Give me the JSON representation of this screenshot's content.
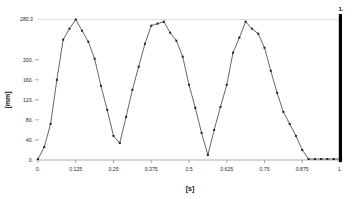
{
  "chart_data": {
    "type": "line",
    "title": "",
    "subtitle": "",
    "xlabel": "[s]",
    "ylabel": "[mm]",
    "xlim": [
      0,
      1
    ],
    "ylim": [
      0,
      280.3
    ],
    "grid": "horizontal-top-only",
    "legend": "none",
    "x_ticks": [
      "0.",
      "0.125",
      "0.25",
      "0.375",
      "0.5",
      "0.625",
      "0.75",
      "0.875",
      "1."
    ],
    "x_tick_values": [
      0,
      0.125,
      0.25,
      0.375,
      0.5,
      0.625,
      0.75,
      0.875,
      1
    ],
    "y_ticks": [
      "0.",
      "40.",
      "80.",
      "120.",
      "160.",
      "200.",
      "280.3"
    ],
    "y_tick_values": [
      0,
      40,
      80,
      120,
      160,
      200,
      280.3
    ],
    "series": [
      {
        "name": "displacement",
        "marker": "square",
        "color": "#333333",
        "x": [
          0,
          0.0208,
          0.0417,
          0.0625,
          0.0833,
          0.1042,
          0.125,
          0.1458,
          0.1667,
          0.1875,
          0.2083,
          0.2292,
          0.25,
          0.2708,
          0.2917,
          0.3125,
          0.3333,
          0.3542,
          0.375,
          0.3958,
          0.4167,
          0.4375,
          0.4583,
          0.4792,
          0.5,
          0.5208,
          0.5417,
          0.5625,
          0.5833,
          0.6042,
          0.625,
          0.6458,
          0.6667,
          0.6875,
          0.7083,
          0.7292,
          0.75,
          0.7708,
          0.7917,
          0.8125,
          0.8333,
          0.8542,
          0.875,
          0.8958,
          0.9167,
          0.9375,
          0.9583,
          0.9792,
          1
        ],
        "y": [
          2,
          26,
          72,
          160,
          240,
          262,
          280.3,
          258,
          236,
          202,
          148,
          100,
          48,
          34,
          86,
          140,
          186,
          232,
          268,
          272,
          276,
          254,
          238,
          206,
          150,
          104,
          54,
          10,
          60,
          106,
          150,
          214,
          244,
          276,
          262,
          252,
          224,
          178,
          134,
          96,
          72,
          48,
          20,
          2,
          2,
          2,
          2,
          2,
          2
        ],
        "points_count": 49
      }
    ],
    "annotations": [
      {
        "name": "cursor-marker",
        "label": "1.",
        "x": 1,
        "type": "vertical-bar",
        "color": "#000000"
      }
    ]
  },
  "axes": {
    "y_title": "[mm]",
    "x_title": "[s]"
  },
  "cursor": {
    "label": "1."
  }
}
